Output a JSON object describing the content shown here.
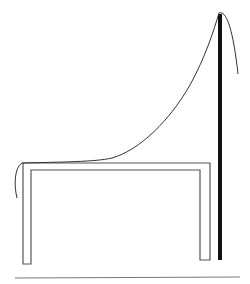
{
  "figure": {
    "type": "line-drawing",
    "colors": {
      "background": "#ffffff",
      "table_stroke": "#555555",
      "pole": "#111111",
      "curve": "#333333",
      "ground": "#777777"
    }
  }
}
